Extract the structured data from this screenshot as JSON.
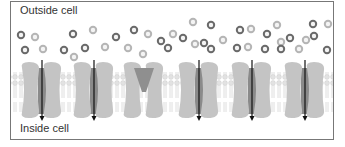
{
  "labels": {
    "outside": "Outside cell",
    "inside": "Inside cell"
  },
  "colors": {
    "border": "#777777",
    "protein": "#c4c4c4",
    "channel_open": "#8a8a8a",
    "channel_closed": "#8f8f8f",
    "lipid": "#d9d9d9",
    "molecule_dark": "#6a6a6a",
    "molecule_light": "#b5b5b5",
    "arrow": "#111111"
  },
  "channels": [
    {
      "x": 42,
      "state": "open",
      "arrow": true
    },
    {
      "x": 94,
      "state": "open",
      "arrow": true
    },
    {
      "x": 144,
      "state": "closed",
      "arrow": false
    },
    {
      "x": 199,
      "state": "open",
      "arrow": true
    },
    {
      "x": 252,
      "state": "open",
      "arrow": true
    },
    {
      "x": 305,
      "state": "open",
      "arrow": true
    }
  ],
  "molecules": [
    {
      "x": 21,
      "y": 35,
      "t": "d"
    },
    {
      "x": 35,
      "y": 37,
      "t": "l"
    },
    {
      "x": 25,
      "y": 50,
      "t": "d"
    },
    {
      "x": 43,
      "y": 49,
      "t": "l"
    },
    {
      "x": 73,
      "y": 34,
      "t": "d"
    },
    {
      "x": 93,
      "y": 30,
      "t": "l"
    },
    {
      "x": 64,
      "y": 50,
      "t": "d"
    },
    {
      "x": 85,
      "y": 48,
      "t": "d"
    },
    {
      "x": 74,
      "y": 57,
      "t": "l"
    },
    {
      "x": 105,
      "y": 47,
      "t": "l"
    },
    {
      "x": 116,
      "y": 37,
      "t": "d"
    },
    {
      "x": 134,
      "y": 30,
      "t": "d"
    },
    {
      "x": 128,
      "y": 48,
      "t": "l"
    },
    {
      "x": 143,
      "y": 54,
      "t": "l"
    },
    {
      "x": 148,
      "y": 34,
      "t": "l"
    },
    {
      "x": 161,
      "y": 41,
      "t": "d"
    },
    {
      "x": 168,
      "y": 48,
      "t": "d"
    },
    {
      "x": 173,
      "y": 34,
      "t": "l"
    },
    {
      "x": 183,
      "y": 38,
      "t": "d"
    },
    {
      "x": 193,
      "y": 22,
      "t": "l"
    },
    {
      "x": 204,
      "y": 43,
      "t": "d"
    },
    {
      "x": 211,
      "y": 25,
      "t": "d"
    },
    {
      "x": 195,
      "y": 44,
      "t": "l"
    },
    {
      "x": 223,
      "y": 40,
      "t": "l"
    },
    {
      "x": 211,
      "y": 49,
      "t": "d"
    },
    {
      "x": 240,
      "y": 30,
      "t": "d"
    },
    {
      "x": 251,
      "y": 29,
      "t": "l"
    },
    {
      "x": 237,
      "y": 48,
      "t": "d"
    },
    {
      "x": 248,
      "y": 47,
      "t": "l"
    },
    {
      "x": 267,
      "y": 34,
      "t": "d"
    },
    {
      "x": 277,
      "y": 25,
      "t": "l"
    },
    {
      "x": 281,
      "y": 42,
      "t": "l"
    },
    {
      "x": 265,
      "y": 49,
      "t": "d"
    },
    {
      "x": 281,
      "y": 49,
      "t": "d"
    },
    {
      "x": 290,
      "y": 38,
      "t": "d"
    },
    {
      "x": 299,
      "y": 49,
      "t": "l"
    },
    {
      "x": 313,
      "y": 24,
      "t": "d"
    },
    {
      "x": 328,
      "y": 24,
      "t": "l"
    },
    {
      "x": 314,
      "y": 36,
      "t": "d"
    },
    {
      "x": 327,
      "y": 50,
      "t": "d"
    },
    {
      "x": 306,
      "y": 40,
      "t": "l"
    }
  ]
}
